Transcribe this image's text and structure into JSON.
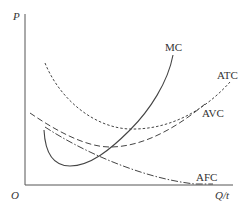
{
  "diagram": {
    "title": "",
    "axes": {
      "y_label": "P",
      "x_label": "Q/t",
      "origin_label": "O"
    },
    "curves": [
      {
        "id": "mc",
        "label": "MC",
        "style": "solid"
      },
      {
        "id": "atc",
        "label": "ATC",
        "style": "dotted"
      },
      {
        "id": "avc",
        "label": "AVC",
        "style": "dashed"
      },
      {
        "id": "afc",
        "label": "AFC",
        "style": "dash-dot"
      }
    ],
    "colors": {
      "line": "#444444",
      "text": "#333333",
      "background": "#ffffff"
    }
  }
}
